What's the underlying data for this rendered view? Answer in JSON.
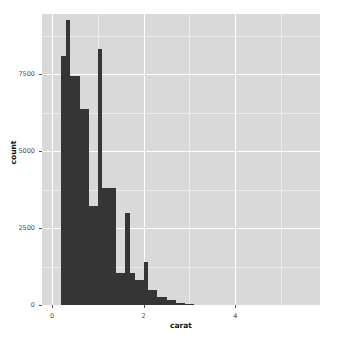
{
  "chart_data": {
    "type": "bar",
    "title": "",
    "subtitle": "",
    "xlabel": "carat",
    "ylabel": "count",
    "grid": true,
    "legend": "none",
    "binwidth": 0.1,
    "xlim": [
      -0.22,
      5.85
    ],
    "ylim": [
      0,
      9450
    ],
    "x_ticks": [
      "0",
      "2",
      "4"
    ],
    "x_tick_values": [
      0,
      2,
      4
    ],
    "y_ticks": [
      "0",
      "2500",
      "5000",
      "7500"
    ],
    "y_tick_values": [
      0,
      2500,
      5000,
      7500
    ],
    "x_minor_values": [
      1,
      3,
      5
    ],
    "y_minor_values": [
      1250,
      3750,
      6250,
      8750
    ],
    "bin_centers": [
      0.25,
      0.35,
      0.45,
      0.55,
      0.65,
      0.75,
      0.85,
      0.95,
      1.05,
      1.15,
      1.25,
      1.35,
      1.45,
      1.55,
      1.65,
      1.75,
      1.85,
      1.95,
      2.05,
      2.15,
      2.25,
      2.35,
      2.45,
      2.55,
      2.65,
      2.75,
      2.85,
      2.95,
      3.05,
      3.25,
      3.45,
      3.65,
      4.05,
      4.15,
      4.25,
      5.05
    ],
    "bin_starts": [
      0.2,
      0.3,
      0.4,
      0.5,
      0.6,
      0.7,
      0.8,
      0.9,
      1.0,
      1.1,
      1.2,
      1.3,
      1.4,
      1.5,
      1.6,
      1.7,
      1.8,
      1.9,
      2.0,
      2.1,
      2.2,
      2.3,
      2.4,
      2.5,
      2.6,
      2.7,
      2.8,
      2.9,
      3.0,
      3.2,
      3.4,
      3.6,
      4.0,
      4.1,
      4.2,
      5.0
    ],
    "values": [
      8080,
      9260,
      7450,
      7450,
      6370,
      6370,
      3200,
      3200,
      8300,
      3800,
      3800,
      3800,
      1040,
      1040,
      2980,
      1040,
      820,
      820,
      1400,
      500,
      500,
      260,
      260,
      150,
      150,
      60,
      60,
      30,
      20,
      12,
      8,
      4,
      2,
      2,
      1,
      1
    ],
    "colors": {
      "bar": "#353535",
      "panel_background": "#d9d9d9",
      "grid_major": "#ffffff",
      "grid_minor": "#ececec",
      "plot_background": "#ffffff",
      "axis_text": "#4d4d4d",
      "axis_title": "#111111"
    }
  }
}
